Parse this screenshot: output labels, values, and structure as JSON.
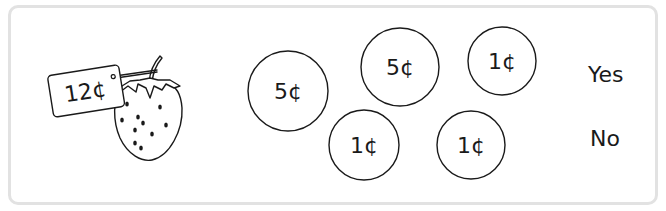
{
  "item": {
    "name": "strawberry",
    "price_tag": "12¢",
    "icon": "strawberry-icon"
  },
  "coins": [
    {
      "label": "5¢",
      "value": 5,
      "cx": 288,
      "cy": 91,
      "r": 40
    },
    {
      "label": "5¢",
      "value": 5,
      "cx": 400,
      "cy": 67,
      "r": 39
    },
    {
      "label": "1¢",
      "value": 1,
      "cx": 502,
      "cy": 61,
      "r": 34
    },
    {
      "label": "1¢",
      "value": 1,
      "cx": 364,
      "cy": 145,
      "r": 35
    },
    {
      "label": "1¢",
      "value": 1,
      "cx": 471,
      "cy": 145,
      "r": 34
    }
  ],
  "answers": {
    "yes": "Yes",
    "no": "No"
  },
  "colors": {
    "frame_border": "#e2e2e2",
    "ink": "#1a1a1a",
    "background": "#ffffff"
  }
}
